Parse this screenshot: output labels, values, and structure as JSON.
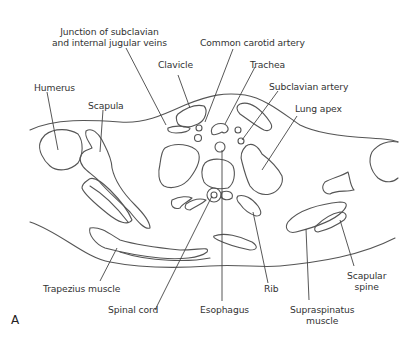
{
  "figure": {
    "panel_letter": "A",
    "line_color": "#555555",
    "background": "#ffffff",
    "labels": {
      "junction": [
        "Junction of subclavian",
        "and internal jugular veins"
      ],
      "common_carotid": "Common carotid artery",
      "clavicle": "Clavicle",
      "trachea": "Trachea",
      "subclavian_artery": "Subclavian artery",
      "humerus": "Humerus",
      "lung_apex": "Lung apex",
      "scapula": "Scapula",
      "trapezius": "Trapezius muscle",
      "spinal_cord": "Spinal cord",
      "esophagus": "Esophagus",
      "rib": "Rib",
      "supraspinatus": [
        "Supraspinatus",
        "muscle"
      ],
      "scapular_spine": [
        "Scapular",
        "spine"
      ]
    }
  }
}
